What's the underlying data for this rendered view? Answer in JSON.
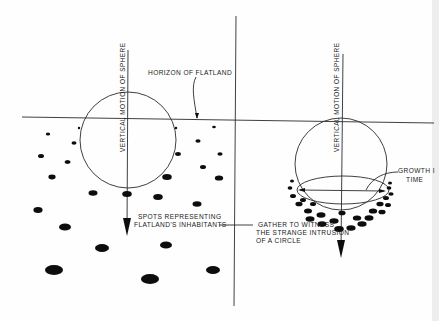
{
  "figure": {
    "left_panel": {
      "vertical_label": "VERTICAL MOTION OF SPHERE",
      "horizon_label": "HORIZON OF FLATLAND",
      "spots_label_line1": "SPOTS REPRESENTING",
      "spots_label_line2": "FLATLAND'S INHABITANTS"
    },
    "right_panel": {
      "vertical_label": "VERTICAL MOTION OF SPHERE",
      "growth_label_line1": "GROWTH I",
      "growth_label_line2": "TIME",
      "gather_label_line1": "GATHER TO WITNESS",
      "gather_label_line2": "THE STRANGE INTRUSION",
      "gather_label_line3": "OF A CIRCLE"
    },
    "colors": {
      "ink": "#111111",
      "paper": "#fefefe"
    }
  }
}
